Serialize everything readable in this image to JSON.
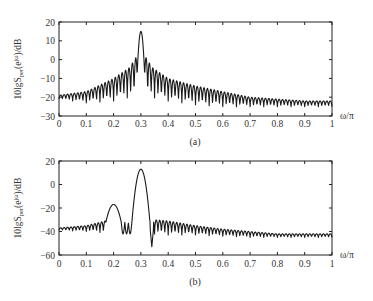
{
  "chart_data": [
    {
      "id": "a",
      "type": "line",
      "caption": "(a)",
      "title": "",
      "xlabel": "ω/π",
      "ylabel": "10lgS_per(e^jω)/dB",
      "ylabel_parts": {
        "main": "10lgS",
        "sub": "per",
        "paren_open": "(e",
        "sup": "jω",
        "paren_close": ")/dB"
      },
      "xlim": [
        0,
        1
      ],
      "ylim": [
        -30,
        20
      ],
      "xticks": [
        0,
        0.1,
        0.2,
        0.3,
        0.4,
        0.5,
        0.6,
        0.7,
        0.8,
        0.9,
        1
      ],
      "xtick_labels": [
        "0",
        "0.1",
        "0.2",
        "0.3",
        "0.4",
        "0.5",
        "0.6",
        "0.7",
        "0.8",
        "0.9",
        "1"
      ],
      "yticks": [
        20,
        10,
        0,
        -10,
        -20,
        -30
      ],
      "ytick_labels": [
        "20",
        "10",
        "0",
        "−10",
        "−20",
        "−30"
      ],
      "grid": false,
      "legend": null,
      "description": "Periodogram with single spectral peak at ω/π=0.3 (~15 dB) and oscillating sidelobes decaying to about -25 dB",
      "peaks": [
        {
          "x": 0.3,
          "y": 15
        }
      ],
      "envelope_upper": {
        "x": [
          0,
          0.1,
          0.2,
          0.26,
          0.28,
          0.32,
          0.34,
          0.4,
          0.5,
          0.6,
          0.7,
          0.8,
          0.9,
          1.0
        ],
        "y": [
          -19,
          -17,
          -10,
          -4,
          1,
          1,
          -4,
          -10,
          -14,
          -17,
          -20,
          -21,
          -22,
          -22
        ]
      },
      "envelope_lower": {
        "x": [
          0,
          0.1,
          0.2,
          0.26,
          0.34,
          0.4,
          0.5,
          0.6,
          0.7,
          0.8,
          0.9,
          1.0
        ],
        "y": [
          -21,
          -23,
          -22,
          -20,
          -20,
          -22,
          -24,
          -25,
          -25,
          -25,
          -25,
          -25
        ]
      },
      "main_lobe": {
        "center": 0.3,
        "halfwidth": 0.017,
        "peak": 15
      },
      "ripple_period": 0.0125
    },
    {
      "id": "b",
      "type": "line",
      "caption": "(b)",
      "title": "",
      "xlabel": "ω/π",
      "ylabel": "10lgS_per(e^jω)/dB",
      "ylabel_parts": {
        "main": "10lgS",
        "sub": "per",
        "paren_open": "(e",
        "sup": "jω",
        "paren_close": ")/dB"
      },
      "xlim": [
        0,
        1
      ],
      "ylim": [
        -60,
        20
      ],
      "xticks": [
        0,
        0.1,
        0.2,
        0.3,
        0.4,
        0.5,
        0.6,
        0.7,
        0.8,
        0.9,
        1
      ],
      "xtick_labels": [
        "0",
        "0.1",
        "0.2",
        "0.3",
        "0.4",
        "0.5",
        "0.6",
        "0.7",
        "0.8",
        "0.9",
        "1"
      ],
      "yticks": [
        20,
        0,
        -20,
        -40,
        -60
      ],
      "ytick_labels": [
        "20",
        "0",
        "−20",
        "−40",
        "−60"
      ],
      "grid": false,
      "legend": null,
      "description": "Periodogram with two peaks: weak at ω/π=0.2 (~-17 dB) and strong at ω/π=0.3 (~13 dB), deep null near 0.34 (~-53 dB), baseline ripples ~-38 to -45 dB",
      "peaks": [
        {
          "x": 0.2,
          "y": -17
        },
        {
          "x": 0.3,
          "y": 13
        }
      ],
      "null": {
        "x": 0.34,
        "y": -53
      },
      "envelope_upper": {
        "x": [
          0,
          0.1,
          0.17,
          0.35,
          0.4,
          0.5,
          0.6,
          0.7,
          0.8,
          0.9,
          1.0
        ],
        "y": [
          -37,
          -35,
          -31,
          -30,
          -31,
          -35,
          -38,
          -40,
          -42,
          -42,
          -42
        ]
      },
      "envelope_lower": {
        "x": [
          0,
          0.1,
          0.17,
          0.35,
          0.4,
          0.5,
          0.6,
          0.7,
          0.8,
          0.9,
          1.0
        ],
        "y": [
          -39,
          -40,
          -41,
          -42,
          -43,
          -43,
          -44,
          -45,
          -45,
          -45,
          -45
        ]
      },
      "lobes": [
        {
          "center": 0.2,
          "halfwidth": 0.028,
          "peak": -17,
          "base": -32
        },
        {
          "center": 0.3,
          "halfwidth": 0.033,
          "peak": 13,
          "base": -32
        }
      ],
      "ripple_period": 0.0125
    }
  ],
  "captions": {
    "a": "(a)",
    "b": "(b)"
  },
  "xlabel_text": "ω/π"
}
